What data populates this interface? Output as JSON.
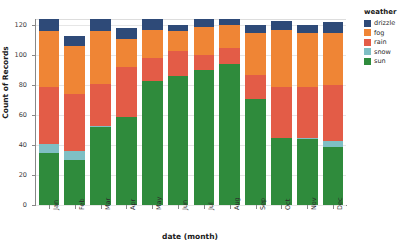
{
  "chart_data": {
    "type": "bar",
    "stacked": true,
    "title": "",
    "xlabel": "date (month)",
    "ylabel": "Count of Records",
    "categories": [
      "Jan",
      "Feb",
      "Mar",
      "Apr",
      "May",
      "Jun",
      "Jul",
      "Aug",
      "Sep",
      "Oct",
      "Nov",
      "Dec"
    ],
    "series": [
      {
        "name": "sun",
        "color": "#2f8b3c",
        "values": [
          35,
          30,
          52,
          59,
          83,
          86,
          90,
          94,
          71,
          45,
          44,
          39
        ]
      },
      {
        "name": "snow",
        "color": "#7fbfc4",
        "values": [
          6,
          6,
          1,
          0,
          0,
          0,
          0,
          0,
          0,
          0,
          1,
          4
        ]
      },
      {
        "name": "rain",
        "color": "#e35c47",
        "values": [
          38,
          38,
          28,
          33,
          15,
          17,
          10,
          11,
          16,
          34,
          34,
          37
        ]
      },
      {
        "name": "fog",
        "color": "#ef8535",
        "values": [
          37,
          32,
          35,
          19,
          19,
          13,
          19,
          15,
          28,
          38,
          36,
          35
        ]
      },
      {
        "name": "drizzle",
        "color": "#2e4a78",
        "values": [
          8,
          7,
          8,
          7,
          7,
          4,
          5,
          4,
          5,
          6,
          5,
          7
        ]
      }
    ],
    "ylim": [
      0,
      120
    ],
    "yticks": [
      0,
      20,
      40,
      60,
      80,
      100,
      120
    ],
    "ytick_labels": [
      "0",
      "20",
      "40",
      "60",
      "80",
      "100",
      "120"
    ],
    "grid": true,
    "legend": {
      "title": "weather",
      "position": "right",
      "entries": [
        {
          "label": "drizzle",
          "color": "#2e4a78"
        },
        {
          "label": "fog",
          "color": "#ef8535"
        },
        {
          "label": "rain",
          "color": "#e35c47"
        },
        {
          "label": "snow",
          "color": "#7fbfc4"
        },
        {
          "label": "sun",
          "color": "#2f8b3c"
        }
      ]
    }
  }
}
